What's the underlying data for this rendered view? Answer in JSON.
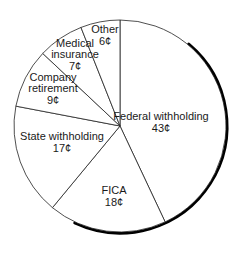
{
  "chart_data": {
    "type": "pie",
    "title": "",
    "unit": "¢",
    "start_angle_deg": 0,
    "direction": "clockwise",
    "categories": [
      "Federal withholding",
      "FICA",
      "State withholding",
      "Company retirement",
      "Medical insurance",
      "Other"
    ],
    "values": [
      43,
      18,
      17,
      9,
      7,
      6
    ],
    "labels": [
      {
        "lines": [
          "Federal withholding",
          "43¢"
        ],
        "x": 161,
        "y": 122
      },
      {
        "lines": [
          "FICA",
          "18¢"
        ],
        "x": 114,
        "y": 196
      },
      {
        "lines": [
          "State withholding",
          "17¢"
        ],
        "x": 62,
        "y": 142
      },
      {
        "lines": [
          "Company",
          "retirement",
          "9¢"
        ],
        "x": 53,
        "y": 88
      },
      {
        "lines": [
          "Medical",
          "insurance",
          "7¢"
        ],
        "x": 75,
        "y": 54
      },
      {
        "lines": [
          "Other",
          "6¢"
        ],
        "x": 105,
        "y": 35
      }
    ],
    "legend": "none",
    "grid": false
  },
  "colors": {
    "slice_fill": "#ffffff",
    "slice_stroke": "#222222",
    "shadow": "#000000"
  },
  "geometry": {
    "cx": 120,
    "cy": 126,
    "r": 106
  }
}
